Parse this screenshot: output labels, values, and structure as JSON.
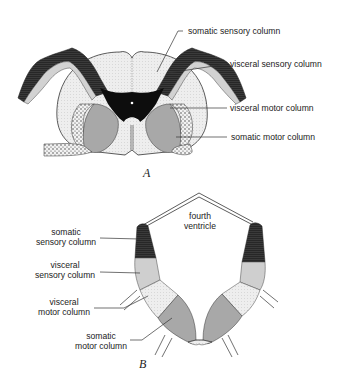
{
  "figure_a": {
    "caption": "A",
    "labels": {
      "somatic_sensory": "somatic sensory column",
      "visceral_sensory": "visceral sensory column",
      "visceral_motor": "visceral motor column",
      "somatic_motor": "somatic motor column"
    }
  },
  "figure_b": {
    "caption": "B",
    "ventricle": [
      "fourth",
      "ventricle"
    ],
    "labels": {
      "somatic_sensory": [
        "somatic",
        "sensory column"
      ],
      "visceral_sensory": [
        "visceral",
        "sensory column"
      ],
      "visceral_motor": [
        "visceral",
        "motor column"
      ],
      "somatic_motor": [
        "somatic",
        "motor column"
      ]
    }
  },
  "colors": {
    "somatic_sensory": "#2e2e2e",
    "visceral_sensory": "#cfcfcf",
    "visceral_motor": "#e6e6e6",
    "somatic_motor": "#a8a8a8",
    "gray_matter_core": "#0d0d0d",
    "white_matter": "#ededed"
  }
}
